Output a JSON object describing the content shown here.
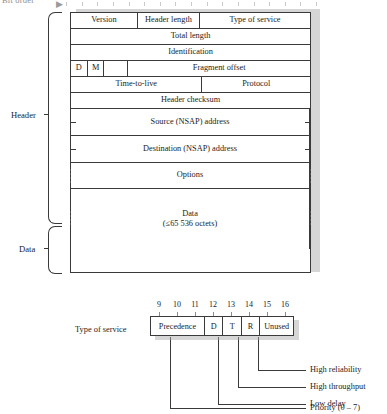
{
  "figure": {
    "bit_order_label": "Bit order",
    "bit_order_arrow": "▶"
  },
  "sections": {
    "header_label": "Header",
    "data_label": "Data"
  },
  "packet": {
    "rows": [
      {
        "name": "row-version",
        "cells": [
          {
            "label": "Version",
            "width": 28
          },
          {
            "label": "Header length",
            "width": 26
          },
          {
            "label": "Type of service",
            "width": 46
          }
        ]
      },
      {
        "name": "row-total-length",
        "cells": [
          {
            "label": "Total length",
            "width": 100
          }
        ]
      },
      {
        "name": "row-identification",
        "cells": [
          {
            "label": "Identification",
            "width": 100
          }
        ]
      },
      {
        "name": "row-flags-fragment",
        "cells": [
          {
            "label": "D",
            "width": 7
          },
          {
            "label": "M",
            "width": 7
          },
          {
            "label": "",
            "width": 10
          },
          {
            "label": "Fragment offset",
            "width": 76
          }
        ]
      },
      {
        "name": "row-ttl-protocol",
        "cells": [
          {
            "label": "Time-to-live",
            "width": 55
          },
          {
            "label": "Protocol",
            "width": 45
          }
        ]
      },
      {
        "name": "row-header-checksum",
        "cells": [
          {
            "label": "Header checksum",
            "width": 100
          }
        ]
      },
      {
        "name": "row-source-address",
        "cells": [
          {
            "label": "Source (NSAP) address",
            "width": 100
          }
        ]
      },
      {
        "name": "row-destination-address",
        "cells": [
          {
            "label": "Destination (NSAP) address",
            "width": 100
          }
        ]
      },
      {
        "name": "row-options",
        "cells": [
          {
            "label": "Options",
            "width": 100
          }
        ]
      }
    ],
    "data_row": {
      "name": "row-data",
      "line1": "Data",
      "line2": "(≤65 536 octets)"
    }
  },
  "tos": {
    "caption": "Type of service",
    "bit_numbers": [
      "9",
      "10",
      "11",
      "12",
      "13",
      "14",
      "15",
      "16"
    ],
    "fields": [
      {
        "label": "Precedence",
        "width": 38
      },
      {
        "label": "D",
        "width": 13
      },
      {
        "label": "T",
        "width": 13
      },
      {
        "label": "R",
        "width": 13
      },
      {
        "label": "Unused",
        "width": 23
      }
    ],
    "callouts": [
      {
        "name": "callout-high-reliability",
        "label": "High reliability"
      },
      {
        "name": "callout-high-throughput",
        "label": "High throughput"
      },
      {
        "name": "callout-low-delay",
        "label": "Low delay"
      },
      {
        "name": "callout-priority",
        "label": "Priority (0 – 7)"
      }
    ]
  },
  "colors": {
    "ink": "#1c1c1c",
    "rule": "#3a3a3a",
    "shadow": "#c8c8c8",
    "tick": "#8d8d8d"
  }
}
